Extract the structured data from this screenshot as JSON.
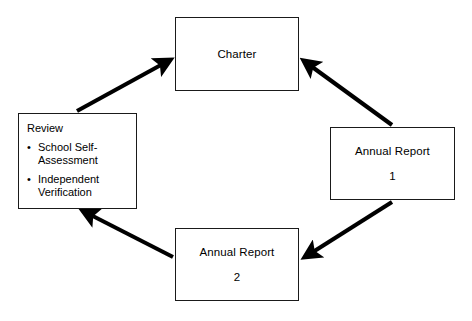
{
  "diagram": {
    "type": "cycle-flow-diagram",
    "colors": {
      "background": "#ffffff",
      "box_border": "#1a1a1a",
      "arrow": "#000000",
      "text": "#000000"
    },
    "nodes": [
      {
        "id": "charter",
        "label": "Charter",
        "sub_label": "",
        "position": "top"
      },
      {
        "id": "annual-report-1",
        "label": "Annual Report",
        "sub_label": "1",
        "position": "right"
      },
      {
        "id": "annual-report-2",
        "label": "Annual Report",
        "sub_label": "2",
        "position": "bottom"
      },
      {
        "id": "review",
        "label": "Review",
        "bullet_marker": "•",
        "bullets": [
          "School Self-Assessment",
          "Independent Verification"
        ],
        "position": "left"
      }
    ],
    "arrows": [
      {
        "id": "review-to-charter",
        "from": "review",
        "to": "charter",
        "direction": "up-right"
      },
      {
        "id": "annual-report-1-to-charter",
        "from": "annual-report-1",
        "to": "charter",
        "direction": "up-left"
      },
      {
        "id": "annual-report-1-to-annual-report-2",
        "from": "annual-report-1",
        "to": "annual-report-2",
        "direction": "down-left"
      },
      {
        "id": "annual-report-2-to-review",
        "from": "annual-report-2",
        "to": "review",
        "direction": "up-left"
      }
    ]
  }
}
